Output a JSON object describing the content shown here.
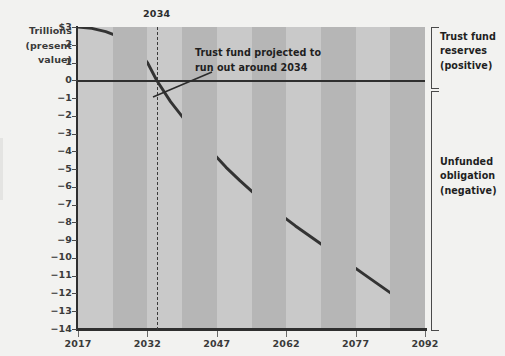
{
  "chart_data": {
    "type": "line",
    "title": "",
    "subtitle": "",
    "xlabel": "",
    "ylabel": "Trillions $ (present value)",
    "ylabel_lines": [
      "Trillions  $3",
      "(present",
      "value)"
    ],
    "axis_label_block": {
      "line1": "Trillions",
      "line2": "(present",
      "line3": "value)"
    },
    "xlim": [
      2017,
      2092
    ],
    "ylim": [
      -14,
      3
    ],
    "grid": false,
    "legend": "none",
    "background_bands": {
      "note": "alternating vertical shading every 7.5 years",
      "light": "#c9c9c9",
      "dark": "#b6b6b6"
    },
    "x_ticks": [
      "2017",
      "2032",
      "2047",
      "2062",
      "2077",
      "2092"
    ],
    "x_tick_values": [
      2017,
      2032,
      2047,
      2062,
      2077,
      2092
    ],
    "y_ticks": [
      "$3",
      "2",
      "1",
      "0",
      "−1",
      "−2",
      "−3",
      "−4",
      "−5",
      "−6",
      "−7",
      "−8",
      "−9",
      "−10",
      "−11",
      "−12",
      "−13",
      "−14"
    ],
    "y_tick_values": [
      3,
      2,
      1,
      0,
      -1,
      -2,
      -3,
      -4,
      -5,
      -6,
      -7,
      -8,
      -9,
      -10,
      -11,
      -12,
      -13,
      -14
    ],
    "series": [
      {
        "name": "Trust fund balance (present value)",
        "color": "#333333",
        "x": [
          2017,
          2020,
          2023,
          2026,
          2029,
          2032,
          2034,
          2037,
          2040,
          2043,
          2046,
          2049,
          2052,
          2055,
          2058,
          2061,
          2064,
          2067,
          2070,
          2073,
          2076,
          2079,
          2082,
          2085,
          2088,
          2092
        ],
        "values": [
          3.0,
          2.92,
          2.74,
          2.45,
          2.03,
          1.0,
          0.0,
          -1.2,
          -2.2,
          -3.15,
          -4.05,
          -4.9,
          -5.65,
          -6.35,
          -7.0,
          -7.6,
          -8.2,
          -8.75,
          -9.3,
          -9.85,
          -10.4,
          -10.95,
          -11.5,
          -12.05,
          -12.55,
          -13.2
        ]
      }
    ],
    "zero_line": 0,
    "annotations": [
      {
        "name": "trust-fund-runout",
        "line1": "Trust fund projected to",
        "line2": "run out around 2034",
        "points_to_year": 2034,
        "points_to_value": 0
      }
    ],
    "markers": [
      {
        "name": "year-2034-dashed-line",
        "label": "2034",
        "x": 2034,
        "style": "dashed"
      }
    ],
    "side_labels": [
      {
        "name": "trust-fund-reserves",
        "line1": "Trust fund",
        "line2": "reserves",
        "line3": "(positive)",
        "range": [
          0,
          3
        ]
      },
      {
        "name": "unfunded-obligation",
        "line1": "Unfunded",
        "line2": "obligation",
        "line3": "(negative)",
        "range": [
          -14,
          0
        ]
      }
    ]
  },
  "colors": {
    "page_background": "#f2f2f0",
    "band_light": "#c9c9c9",
    "band_dark": "#b6b6b6",
    "line": "#333333",
    "axis": "#2f2f2f",
    "text": "#2d2d2d"
  }
}
